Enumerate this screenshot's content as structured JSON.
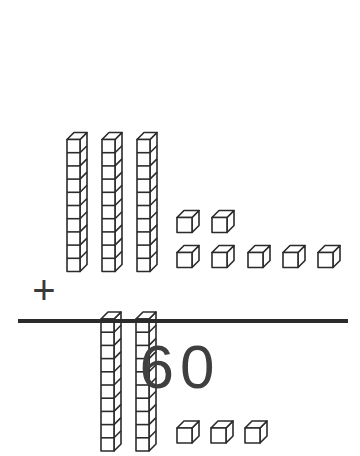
{
  "worksheet": {
    "type": "base-ten-blocks-addition",
    "operator": "+",
    "sum_label": "60",
    "line_color": "#2b2b2b",
    "ink_color": "#2b2b2b",
    "numeral_color": "#3f3f3f",
    "background_color": "#ffffff"
  },
  "addends": [
    {
      "name": "first-addend",
      "value": 37,
      "tens_rods": 3,
      "units_per_rod": 10,
      "ones_cubes": 7,
      "ones_rows": [
        2,
        5
      ]
    },
    {
      "name": "second-addend",
      "value": 23,
      "tens_rods": 2,
      "units_per_rod": 10,
      "ones_cubes": 3,
      "ones_rows": [
        3
      ]
    }
  ],
  "result": {
    "value": 60,
    "text": "60"
  }
}
